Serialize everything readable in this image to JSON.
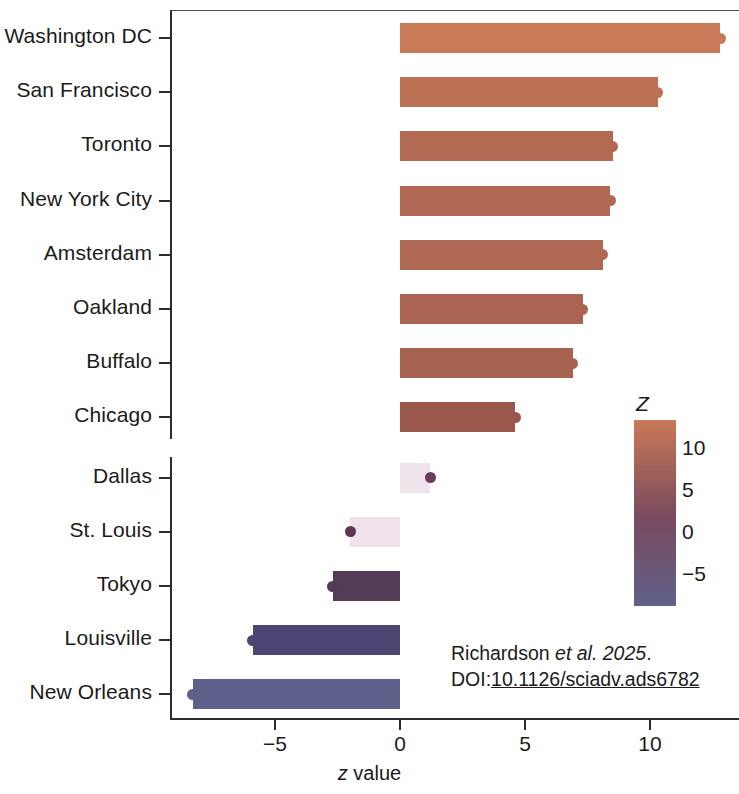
{
  "chart_data": {
    "type": "bar",
    "orientation": "horizontal",
    "title": "",
    "xlabel": "z value",
    "ylabel": "",
    "xlim": [
      -9.2,
      13.5
    ],
    "xticks": [
      -5,
      0,
      5,
      10
    ],
    "xticklabels": [
      "−5",
      "0",
      "5",
      "10"
    ],
    "grid": false,
    "categories": [
      "Washington DC",
      "San Francisco",
      "Toronto",
      "New York City",
      "Amsterdam",
      "Oakland",
      "Buffalo",
      "Chicago",
      "Dallas",
      "St. Louis",
      "Tokyo",
      "Louisville",
      "New Orleans"
    ],
    "values": [
      12.8,
      10.3,
      8.5,
      8.4,
      8.1,
      7.3,
      6.9,
      4.6,
      1.2,
      -2.0,
      -2.7,
      -5.9,
      -8.3
    ],
    "bar_colors": [
      "#c87a56",
      "#bd7154",
      "#b26a53",
      "#b16953",
      "#af6852",
      "#aa6451",
      "#a86250",
      "#9a584c",
      "#f0e4ec",
      "#efe2ea",
      "#533a55",
      "#4e4672",
      "#5d618c"
    ],
    "tip_colors": [
      "#c87a56",
      "#bd7154",
      "#b26a53",
      "#b16953",
      "#af6852",
      "#aa6451",
      "#a86250",
      "#9a584c",
      "#6b3a5c",
      "#5d3456",
      "#533a55",
      "#4e4672",
      "#5d618c"
    ],
    "group_separator_after": "Chicago",
    "legend": {
      "title": "Z",
      "type": "colorbar",
      "position": "right-inside",
      "ticks": [
        10,
        5,
        0,
        -5
      ],
      "ticklabels": [
        "10",
        "5",
        "0",
        "−5"
      ],
      "range": [
        -8.5,
        13.5
      ],
      "color_high": "#c87a56",
      "color_mid": "#7a4a5e",
      "color_low": "#5f6189"
    },
    "annotations": [
      {
        "name": "citation",
        "line1_text": "Richardson ",
        "line1_italic": "et al. 2025",
        "line1_tail": ".",
        "line2_prefix": "DOI:",
        "line2_link": "10.1126/sciadv.ads6782"
      }
    ]
  },
  "axis": {
    "x_title_italic": "z",
    "x_title_rest": " value"
  }
}
